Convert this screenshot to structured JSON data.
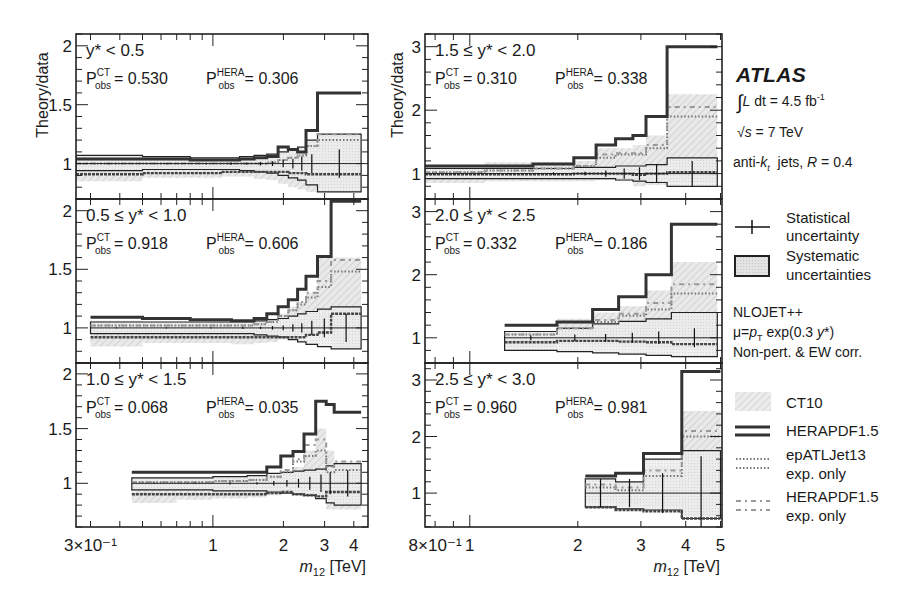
{
  "figure": {
    "ylabel": "Theory/data",
    "xlabel_left": "m12 [TeV]",
    "xlabel_right": "m12 [TeV]",
    "left_xticks": [
      {
        "v": 0.3,
        "label": "3×10⁻¹"
      },
      {
        "v": 1,
        "label": "1"
      },
      {
        "v": 2,
        "label": "2"
      },
      {
        "v": 3,
        "label": "3"
      },
      {
        "v": 4,
        "label": "4"
      }
    ],
    "right_xticks": [
      {
        "v": 0.8,
        "label": "8×10⁻¹"
      },
      {
        "v": 1,
        "label": "1"
      },
      {
        "v": 2,
        "label": "2"
      },
      {
        "v": 3,
        "label": "3"
      },
      {
        "v": 4,
        "label": "4"
      },
      {
        "v": 5,
        "label": "5"
      }
    ]
  },
  "legend": {
    "experiment": "ATLAS",
    "lumi": "∫L dt = 4.5 fb⁻¹",
    "sqrt_s": "√s = 7 TeV",
    "jets": "anti-kt jets, R = 0.4",
    "stat_line1": "Statistical",
    "stat_line2": "uncertainty",
    "syst_line1": "Systematic",
    "syst_line2": "uncertainties",
    "calc_line1": "NLOJET++",
    "calc_line2": "μ=pT exp(0.3 y*)",
    "calc_line3": "Non-pert. & EW corr.",
    "ct10": "CT10",
    "hera": "HERAPDF1.5",
    "epatl_line1": "epATLJet13",
    "epatl_line2": "exp. only",
    "heraexp_line1": "HERAPDF1.5",
    "heraexp_line2": "exp. only"
  },
  "colors": {
    "frame": "#222222",
    "hera": "#333333",
    "ct10_fill": "#e4e4e4",
    "syst_fill": "#ececec",
    "dotted": "#777777",
    "dashdot": "#888888"
  },
  "chart_data": [
    {
      "type": "line",
      "title": "y* < 0.5",
      "rapidity_bin": "y* < 0.5",
      "p_obs_CT": "0.530",
      "p_obs_HERA": "0.306",
      "xlabel": "m12 [TeV]",
      "ylabel": "Theory/data",
      "xscale": "log",
      "xlim": [
        0.26,
        4.6
      ],
      "ylim": [
        0.7,
        2.1
      ],
      "yticks": [
        1,
        1.5,
        2
      ],
      "bin_edges": [
        0.26,
        0.5,
        0.8,
        1.1,
        1.3,
        1.5,
        1.7,
        1.9,
        2.1,
        2.3,
        2.5,
        2.8,
        4.3
      ],
      "series": [
        {
          "name": "HERAPDF1.5",
          "values": [
            1.04,
            1.04,
            1.03,
            1.03,
            1.04,
            1.05,
            1.06,
            1.14,
            1.12,
            1.1,
            1.28,
            1.6
          ]
        },
        {
          "name": "CT10",
          "values": [
            1.0,
            1.0,
            1.0,
            1.0,
            1.0,
            1.0,
            1.0,
            1.0,
            1.0,
            1.0,
            1.0,
            1.0
          ]
        },
        {
          "name": "CT10 up",
          "values": [
            1.07,
            1.06,
            1.05,
            1.05,
            1.06,
            1.07,
            1.08,
            1.1,
            1.1,
            1.12,
            1.2,
            1.25
          ]
        },
        {
          "name": "CT10 down",
          "values": [
            0.85,
            0.88,
            0.88,
            0.89,
            0.89,
            0.87,
            0.86,
            0.83,
            0.8,
            0.78,
            0.76,
            0.78
          ]
        },
        {
          "name": "Systematic up",
          "values": [
            1.07,
            1.06,
            1.05,
            1.05,
            1.06,
            1.07,
            1.08,
            1.1,
            1.12,
            1.14,
            1.2,
            1.25
          ]
        },
        {
          "name": "Systematic down",
          "values": [
            0.94,
            0.95,
            0.95,
            0.95,
            0.94,
            0.93,
            0.92,
            0.9,
            0.88,
            0.86,
            0.82,
            0.76
          ]
        },
        {
          "name": "epATLJet13 exp. only",
          "values": [
            1.0,
            1.0,
            1.0,
            1.0,
            1.0,
            1.0,
            1.01,
            1.03,
            1.05,
            1.07,
            1.15,
            1.2
          ]
        },
        {
          "name": "HERAPDF1.5 exp. only",
          "values": [
            1.0,
            1.0,
            1.0,
            1.0,
            1.0,
            1.0,
            1.01,
            1.03,
            1.05,
            1.07,
            1.15,
            1.25
          ]
        },
        {
          "name": "Central",
          "values": [
            0.91,
            0.92,
            0.92,
            0.93,
            0.93,
            0.93,
            0.93,
            0.93,
            0.92,
            0.92,
            0.91,
            0.91
          ]
        }
      ],
      "stat_err": [
        0.005,
        0.005,
        0.005,
        0.01,
        0.01,
        0.015,
        0.02,
        0.03,
        0.04,
        0.06,
        0.08,
        0.12
      ]
    },
    {
      "type": "line",
      "title": "0.5 ≤ y* < 1.0",
      "rapidity_bin": "0.5 ≤ y* < 1.0",
      "p_obs_CT": "0.918",
      "p_obs_HERA": "0.606",
      "xlabel": "m12 [TeV]",
      "ylabel": "Theory/data",
      "xscale": "log",
      "xlim": [
        0.26,
        4.6
      ],
      "ylim": [
        0.7,
        2.1
      ],
      "yticks": [
        1,
        1.5,
        2
      ],
      "bin_edges": [
        0.3,
        0.5,
        0.8,
        1.2,
        1.5,
        1.7,
        1.9,
        2.1,
        2.3,
        2.5,
        2.8,
        3.2,
        4.3
      ],
      "series": [
        {
          "name": "HERAPDF1.5",
          "values": [
            1.09,
            1.08,
            1.07,
            1.06,
            1.08,
            1.12,
            1.18,
            1.24,
            1.33,
            1.44,
            1.61,
            2.08
          ]
        },
        {
          "name": "CT10",
          "values": [
            1.0,
            1.0,
            1.0,
            1.0,
            1.0,
            1.0,
            1.0,
            1.0,
            1.0,
            1.0,
            1.0,
            1.0
          ]
        },
        {
          "name": "CT10 up",
          "values": [
            1.06,
            1.05,
            1.05,
            1.05,
            1.06,
            1.08,
            1.12,
            1.18,
            1.22,
            1.3,
            1.6,
            1.6
          ]
        },
        {
          "name": "CT10 down",
          "values": [
            0.84,
            0.87,
            0.87,
            0.86,
            0.87,
            0.88,
            0.9,
            0.92,
            0.94,
            0.94,
            0.94,
            0.82
          ]
        },
        {
          "name": "Systematic up",
          "values": [
            1.05,
            1.05,
            1.05,
            1.05,
            1.06,
            1.07,
            1.08,
            1.1,
            1.12,
            1.14,
            1.16,
            1.18
          ]
        },
        {
          "name": "Systematic down",
          "values": [
            0.95,
            0.95,
            0.95,
            0.95,
            0.94,
            0.93,
            0.92,
            0.9,
            0.88,
            0.86,
            0.84,
            0.82
          ]
        },
        {
          "name": "epATLJet13 exp. only",
          "values": [
            1.02,
            1.02,
            1.02,
            1.02,
            1.03,
            1.05,
            1.1,
            1.15,
            1.2,
            1.26,
            1.35,
            1.48
          ]
        },
        {
          "name": "HERAPDF1.5 exp. only",
          "values": [
            1.02,
            1.02,
            1.02,
            1.02,
            1.03,
            1.05,
            1.1,
            1.15,
            1.22,
            1.3,
            1.4,
            1.58
          ]
        },
        {
          "name": "Central",
          "values": [
            0.92,
            0.92,
            0.92,
            0.92,
            0.92,
            0.92,
            0.92,
            0.92,
            0.92,
            0.94,
            0.96,
            1.12
          ]
        }
      ],
      "stat_err": [
        0.005,
        0.005,
        0.005,
        0.01,
        0.01,
        0.015,
        0.02,
        0.03,
        0.04,
        0.06,
        0.08,
        0.12
      ]
    },
    {
      "type": "line",
      "title": "1.0 ≤ y* < 1.5",
      "rapidity_bin": "1.0 ≤ y* < 1.5",
      "p_obs_CT": "0.068",
      "p_obs_HERA": "0.035",
      "xlabel": "m12 [TeV]",
      "ylabel": "Theory/data",
      "xscale": "log",
      "xlim": [
        0.26,
        4.6
      ],
      "ylim": [
        0.6,
        2.1
      ],
      "yticks": [
        1,
        1.5,
        2
      ],
      "bin_edges": [
        0.45,
        0.7,
        1.0,
        1.4,
        1.7,
        1.95,
        2.2,
        2.45,
        2.75,
        3.05,
        3.3,
        4.3
      ],
      "series": [
        {
          "name": "HERAPDF1.5",
          "values": [
            1.1,
            1.1,
            1.1,
            1.1,
            1.15,
            1.25,
            1.29,
            1.45,
            1.75,
            1.72,
            1.65
          ]
        },
        {
          "name": "CT10",
          "values": [
            1.0,
            1.0,
            1.0,
            1.0,
            1.0,
            1.0,
            1.0,
            1.0,
            1.0,
            1.0,
            1.0
          ]
        },
        {
          "name": "CT10 up",
          "values": [
            1.05,
            1.05,
            1.05,
            1.05,
            1.07,
            1.1,
            1.15,
            1.3,
            1.5,
            1.3,
            1.2
          ]
        },
        {
          "name": "CT10 down",
          "values": [
            0.82,
            0.85,
            0.86,
            0.87,
            0.89,
            0.92,
            0.89,
            0.88,
            0.87,
            0.76,
            0.76
          ]
        },
        {
          "name": "Systematic up",
          "values": [
            1.05,
            1.05,
            1.06,
            1.07,
            1.09,
            1.1,
            1.11,
            1.12,
            1.13,
            1.16,
            1.18
          ]
        },
        {
          "name": "Systematic down",
          "values": [
            0.94,
            0.94,
            0.93,
            0.93,
            0.92,
            0.91,
            0.9,
            0.89,
            0.86,
            0.82,
            0.8
          ]
        },
        {
          "name": "epATLJet13 exp. only",
          "values": [
            1.01,
            1.01,
            1.02,
            1.03,
            1.06,
            1.1,
            1.2,
            1.25,
            1.3,
            1.1,
            1.12
          ]
        },
        {
          "name": "HERAPDF1.5 exp. only",
          "values": [
            1.01,
            1.01,
            1.02,
            1.03,
            1.06,
            1.12,
            1.22,
            1.35,
            1.4,
            1.15,
            1.2
          ]
        },
        {
          "name": "Central",
          "values": [
            0.9,
            0.9,
            0.9,
            0.9,
            0.91,
            0.92,
            0.9,
            0.89,
            0.88,
            0.92,
            0.92
          ]
        }
      ],
      "stat_err": [
        0.005,
        0.005,
        0.01,
        0.01,
        0.02,
        0.03,
        0.04,
        0.06,
        0.08,
        0.1,
        0.12
      ]
    },
    {
      "type": "line",
      "title": "1.5 ≤ y* < 2.0",
      "rapidity_bin": "1.5 ≤ y* < 2.0",
      "p_obs_CT": "0.310",
      "p_obs_HERA": "0.338",
      "xlabel": "m12 [TeV]",
      "ylabel": "Theory/data",
      "xscale": "log",
      "xlim": [
        0.75,
        5.05
      ],
      "ylim": [
        0.6,
        3.2
      ],
      "yticks": [
        1,
        2,
        3
      ],
      "bin_edges": [
        0.75,
        1.1,
        1.5,
        1.95,
        2.25,
        2.55,
        2.85,
        3.1,
        3.55,
        4.9
      ],
      "series": [
        {
          "name": "HERAPDF1.5",
          "values": [
            1.12,
            1.12,
            1.15,
            1.25,
            1.45,
            1.55,
            1.6,
            1.9,
            3.0
          ]
        },
        {
          "name": "CT10",
          "values": [
            1.0,
            1.0,
            1.0,
            1.0,
            1.0,
            1.0,
            1.0,
            1.0,
            1.0
          ]
        },
        {
          "name": "CT10 up",
          "values": [
            1.1,
            1.18,
            1.18,
            1.2,
            1.4,
            1.4,
            1.45,
            1.6,
            2.25
          ]
        },
        {
          "name": "CT10 down",
          "values": [
            0.85,
            0.88,
            0.88,
            0.88,
            0.9,
            0.88,
            0.8,
            0.82,
            0.85
          ]
        },
        {
          "name": "Systematic up",
          "values": [
            1.08,
            1.08,
            1.08,
            1.1,
            1.1,
            1.12,
            1.12,
            1.14,
            1.25
          ]
        },
        {
          "name": "Systematic down",
          "values": [
            0.92,
            0.92,
            0.92,
            0.92,
            0.92,
            0.9,
            0.88,
            0.86,
            0.8
          ]
        },
        {
          "name": "epATLJet13 exp. only",
          "values": [
            1.02,
            1.05,
            1.08,
            1.12,
            1.25,
            1.3,
            1.3,
            1.4,
            1.9
          ]
        },
        {
          "name": "HERAPDF1.5 exp. only",
          "values": [
            1.02,
            1.05,
            1.08,
            1.12,
            1.3,
            1.32,
            1.32,
            1.45,
            2.05
          ]
        },
        {
          "name": "Central",
          "values": [
            0.99,
            0.99,
            0.99,
            1.0,
            1.0,
            1.0,
            0.98,
            1.0,
            1.02
          ]
        }
      ],
      "stat_err": [
        0.01,
        0.01,
        0.02,
        0.03,
        0.05,
        0.08,
        0.1,
        0.15,
        0.2
      ]
    },
    {
      "type": "line",
      "title": "2.0 ≤ y* < 2.5",
      "rapidity_bin": "2.0 ≤ y* < 2.5",
      "p_obs_CT": "0.332",
      "p_obs_HERA": "0.186",
      "xlabel": "m12 [TeV]",
      "ylabel": "Theory/data",
      "xscale": "log",
      "xlim": [
        0.75,
        5.05
      ],
      "ylim": [
        0.6,
        3.2
      ],
      "yticks": [
        1,
        2,
        3
      ],
      "bin_edges": [
        1.25,
        1.75,
        2.2,
        2.6,
        3.1,
        3.65,
        4.9
      ],
      "series": [
        {
          "name": "HERAPDF1.5",
          "values": [
            1.2,
            1.25,
            1.45,
            1.65,
            2.0,
            2.8
          ]
        },
        {
          "name": "CT10",
          "values": [
            1.0,
            1.0,
            1.0,
            1.0,
            1.0,
            1.0
          ]
        },
        {
          "name": "CT10 up",
          "values": [
            1.1,
            1.3,
            1.4,
            1.5,
            1.75,
            2.2
          ]
        },
        {
          "name": "CT10 down",
          "values": [
            0.85,
            0.88,
            0.88,
            0.87,
            0.84,
            0.82
          ]
        },
        {
          "name": "Systematic up",
          "values": [
            1.1,
            1.15,
            1.22,
            1.26,
            1.3,
            1.4
          ]
        },
        {
          "name": "Systematic down",
          "values": [
            0.8,
            0.78,
            0.76,
            0.74,
            0.72,
            0.7
          ]
        },
        {
          "name": "epATLJet13 exp. only",
          "values": [
            1.05,
            1.15,
            1.25,
            1.35,
            1.45,
            1.7
          ]
        },
        {
          "name": "HERAPDF1.5 exp. only",
          "values": [
            1.05,
            1.15,
            1.28,
            1.38,
            1.55,
            1.85
          ]
        },
        {
          "name": "Central",
          "values": [
            0.93,
            0.95,
            0.95,
            0.94,
            0.93,
            0.9
          ]
        }
      ],
      "stat_err": [
        0.04,
        0.05,
        0.06,
        0.08,
        0.1,
        0.15
      ]
    },
    {
      "type": "line",
      "title": "2.5 ≤ y* < 3.0",
      "rapidity_bin": "2.5 ≤ y* < 3.0",
      "p_obs_CT": "0.960",
      "p_obs_HERA": "0.981",
      "xlabel": "m12 [TeV]",
      "ylabel": "Theory/data",
      "xscale": "log",
      "xlim": [
        0.75,
        5.05
      ],
      "ylim": [
        0.4,
        3.3
      ],
      "yticks": [
        1,
        2,
        3
      ],
      "bin_edges": [
        2.1,
        2.55,
        3.05,
        3.9,
        5.0
      ],
      "series": [
        {
          "name": "HERAPDF1.5",
          "values": [
            1.3,
            1.35,
            1.7,
            3.15
          ]
        },
        {
          "name": "CT10",
          "values": [
            1.0,
            1.0,
            1.0,
            1.0
          ]
        },
        {
          "name": "CT10 up",
          "values": [
            1.15,
            1.2,
            1.45,
            2.45
          ]
        },
        {
          "name": "CT10 down",
          "values": [
            0.85,
            0.8,
            0.75,
            0.6
          ]
        },
        {
          "name": "Systematic up",
          "values": [
            1.25,
            1.2,
            1.6,
            1.75
          ]
        },
        {
          "name": "Systematic down",
          "values": [
            0.75,
            0.72,
            0.7,
            0.55
          ]
        },
        {
          "name": "epATLJet13 exp. only",
          "values": [
            1.1,
            1.05,
            1.3,
            2.0
          ]
        },
        {
          "name": "HERAPDF1.5 exp. only",
          "values": [
            1.15,
            1.1,
            1.4,
            2.1
          ]
        },
        {
          "name": "Central",
          "values": [
            0.75,
            0.7,
            0.68,
            0.55
          ]
        }
      ],
      "stat_err": [
        0.25,
        0.25,
        0.35,
        0.65
      ]
    }
  ]
}
